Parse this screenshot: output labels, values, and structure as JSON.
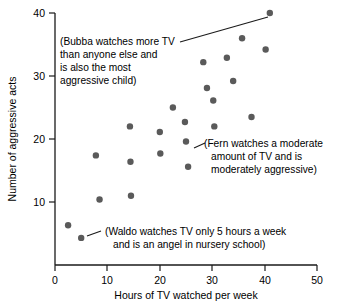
{
  "chart_data": {
    "type": "scatter",
    "title": "",
    "xlabel": "Hours of TV watched per week",
    "ylabel": "Number of aggressive acts",
    "xlim": [
      0,
      50
    ],
    "ylim": [
      0,
      40
    ],
    "xticks": [
      0,
      10,
      20,
      30,
      40,
      50
    ],
    "yticks": [
      10,
      20,
      30,
      40
    ],
    "xtick_labels": [
      "0",
      "10",
      "20",
      "30",
      "40",
      "50"
    ],
    "ytick_labels": [
      "10",
      "20",
      "30",
      "40"
    ],
    "grid": false,
    "legend": false,
    "marker_color": "#5a5a5a",
    "axis_color": "#1a1a1a",
    "points": [
      {
        "x": 2.5,
        "y": 6.3
      },
      {
        "x": 5.0,
        "y": 4.3
      },
      {
        "x": 7.8,
        "y": 17.4
      },
      {
        "x": 8.5,
        "y": 10.4
      },
      {
        "x": 14.3,
        "y": 22.0
      },
      {
        "x": 14.4,
        "y": 16.4
      },
      {
        "x": 14.5,
        "y": 11.0
      },
      {
        "x": 20.0,
        "y": 21.1
      },
      {
        "x": 20.1,
        "y": 17.7
      },
      {
        "x": 22.5,
        "y": 25.0
      },
      {
        "x": 24.8,
        "y": 22.7
      },
      {
        "x": 25.0,
        "y": 19.6
      },
      {
        "x": 25.4,
        "y": 15.6
      },
      {
        "x": 28.3,
        "y": 32.2
      },
      {
        "x": 29.0,
        "y": 28.1
      },
      {
        "x": 30.2,
        "y": 26.1
      },
      {
        "x": 30.4,
        "y": 22.0
      },
      {
        "x": 32.8,
        "y": 32.9
      },
      {
        "x": 34.0,
        "y": 29.2
      },
      {
        "x": 35.7,
        "y": 36.0
      },
      {
        "x": 37.5,
        "y": 23.5
      },
      {
        "x": 40.2,
        "y": 34.2
      },
      {
        "x": 41.0,
        "y": 40.0
      }
    ],
    "annotations": [
      {
        "name": "bubba",
        "lines": [
          "(Bubba watches more TV",
          "than anyone else and",
          "is also the most",
          "aggressive child)"
        ],
        "target_point": {
          "x": 41.0,
          "y": 40.0
        }
      },
      {
        "name": "fern",
        "lines": [
          "(Fern watches a moderate",
          "amount of TV and is",
          "moderately aggressive)"
        ],
        "target_point": {
          "x": 25.0,
          "y": 19.6
        }
      },
      {
        "name": "waldo",
        "lines": [
          "(Waldo watches TV only 5 hours a week",
          "and is an angel in nursery school)"
        ],
        "target_point": {
          "x": 5.0,
          "y": 4.3
        }
      }
    ]
  },
  "axes": {
    "x_title": "Hours of TV watched per week",
    "y_title": "Number of aggressive acts",
    "x_tick_0": "0",
    "x_tick_1": "10",
    "x_tick_2": "20",
    "x_tick_3": "30",
    "x_tick_4": "40",
    "x_tick_5": "50",
    "y_tick_0": "10",
    "y_tick_1": "20",
    "y_tick_2": "30",
    "y_tick_3": "40"
  },
  "annotations": {
    "bubba": {
      "line_0": "(Bubba watches more TV",
      "line_1": "than anyone else and",
      "line_2": "is also the most",
      "line_3": "aggressive child)"
    },
    "fern": {
      "line_0": "(Fern watches a moderate",
      "line_1": "amount of TV and is",
      "line_2": "moderately aggressive)"
    },
    "waldo": {
      "line_0": "(Waldo watches TV only 5 hours a week",
      "line_1": "and is an angel in nursery school)"
    }
  }
}
